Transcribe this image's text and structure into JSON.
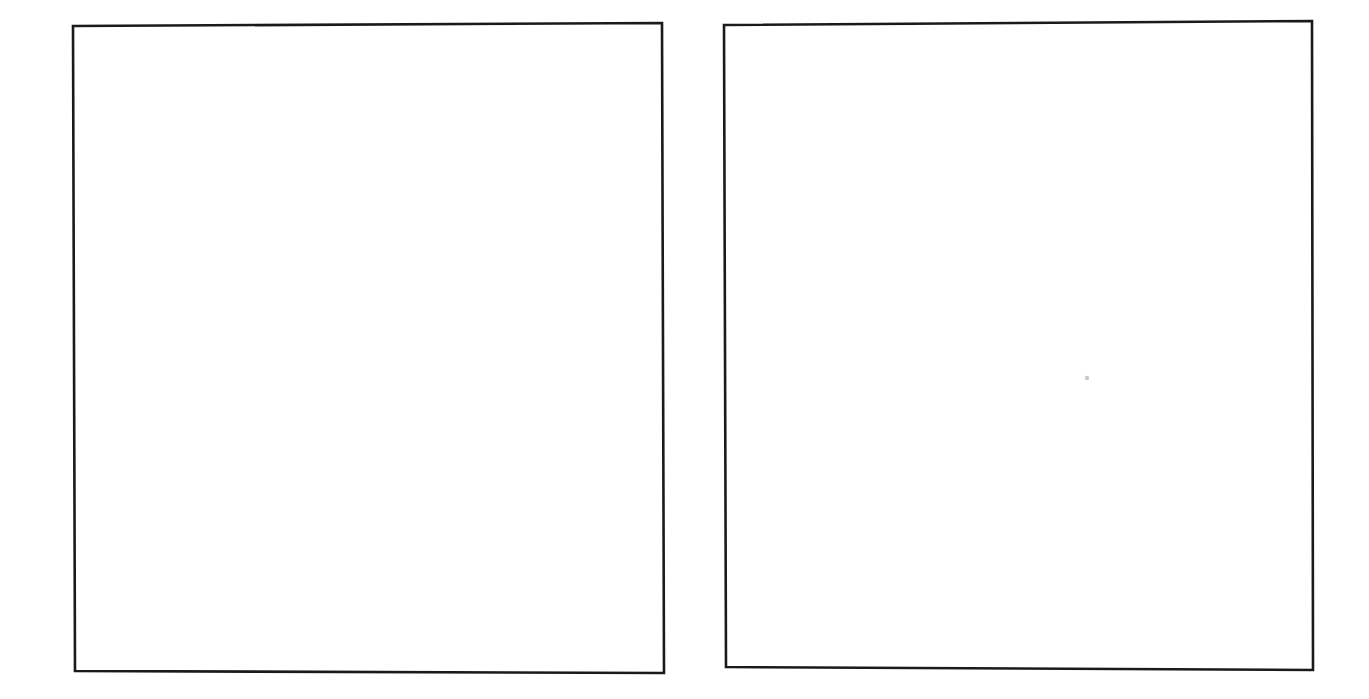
{
  "page": {
    "kind": "scanned-document-page",
    "width": 1369,
    "height": 699,
    "background_color": "#ffffff",
    "ink_color": "#1a1a1a",
    "visible_text": "",
    "caption": ""
  },
  "frames": [
    {
      "id": "left-frame",
      "name": "left-empty-frame",
      "label": "",
      "content": "",
      "is_empty": true,
      "stroke_color": "#1a1a1a",
      "fill_color": "#ffffff",
      "stroke_width": 2.6,
      "bounds": {
        "x": 72,
        "y": 23,
        "width": 592,
        "height": 653
      },
      "corners": {
        "top_left": {
          "x": 73,
          "y": 26
        },
        "top_right": {
          "x": 662,
          "y": 23
        },
        "bottom_right": {
          "x": 664,
          "y": 673
        },
        "bottom_left": {
          "x": 75,
          "y": 671
        }
      }
    },
    {
      "id": "right-frame",
      "name": "right-empty-frame",
      "label": "",
      "content": "",
      "is_empty": true,
      "stroke_color": "#1a1a1a",
      "fill_color": "#ffffff",
      "stroke_width": 2.6,
      "bounds": {
        "x": 722,
        "y": 20,
        "width": 592,
        "height": 652
      },
      "corners": {
        "top_left": {
          "x": 724,
          "y": 25
        },
        "top_right": {
          "x": 1312,
          "y": 21
        },
        "bottom_right": {
          "x": 1313,
          "y": 670
        },
        "bottom_left": {
          "x": 726,
          "y": 667
        }
      }
    }
  ],
  "artifacts": [
    {
      "id": "speck-1",
      "name": "scan-speck",
      "kind": "dust-speck",
      "x": 1087,
      "y": 378,
      "radius": 2.2,
      "color": "#c9c9c9"
    }
  ],
  "margins": {
    "top": "",
    "bottom": "",
    "left": "",
    "right": "",
    "gutter": ""
  }
}
